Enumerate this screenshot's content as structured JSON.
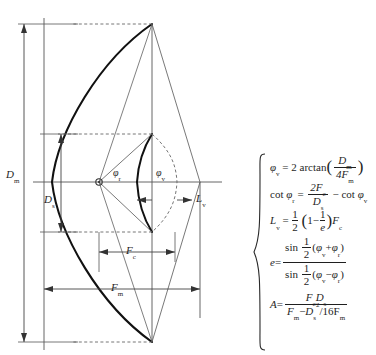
{
  "figure": {
    "colors": {
      "reflector_curve": "#111111",
      "construction_line": "#555555",
      "dimension_line": "#444444",
      "dashed_line": "#666666",
      "background": "#ffffff"
    },
    "labels": {
      "d_m": "D",
      "d_m_sub": "m",
      "d_s": "D",
      "d_s_sub": "s",
      "f_c": "F",
      "f_c_sub": "c",
      "f_m": "F",
      "f_m_sub": "m",
      "l_v": "L",
      "l_v_sub": "v",
      "phi_r": "φ",
      "phi_r_sub": "r",
      "phi_v": "φ",
      "phi_v_sub": "v"
    },
    "geometry": {
      "axis_y": 182,
      "vertex_x": 44,
      "focus_x": 99,
      "focus_y": 182,
      "rim_upper": [
        152,
        134
      ],
      "rim_lower": [
        152,
        232
      ],
      "aperture_top": [
        152,
        24
      ],
      "aperture_bottom": [
        152,
        342
      ],
      "right_edge_x": 200,
      "fm_right_x": 200,
      "fc_right_x": 175
    }
  },
  "equations": {
    "brace_label": "equation-group-brace",
    "items": [
      {
        "name": "phi-v-equation",
        "plain": "φ_v = 2 arctan( D_m / 4F_m )",
        "lhs": "φ",
        "lhs_sub": "v",
        "rhs_lead": "2 arctan",
        "num": "D",
        "num_sub": "m",
        "den": "4F",
        "den_sub": "m"
      },
      {
        "name": "cot-phi-r-equation",
        "plain": "cot φ_r = 2F_c / D_s − cot φ_v",
        "op": "cot",
        "lhs": "φ",
        "lhs_sub": "r",
        "num": "2F",
        "num_sub": "c",
        "den": "D",
        "den_sub": "s",
        "tail_op": "cot",
        "tail": "φ",
        "tail_sub": "v"
      },
      {
        "name": "l-v-equation",
        "plain": "L_v = 1/2 ( 1 − 1/e ) F_c",
        "lhs": "L",
        "lhs_sub": "v",
        "half_num": "1",
        "half_den": "2",
        "inner_one": "1",
        "inner_num": "1",
        "inner_den": "e",
        "tail": "F",
        "tail_sub": "c"
      },
      {
        "name": "e-equation",
        "plain": "e = sin 1/2 (φ_v + φ_r) / sin 1/2 (φ_v − φ_r)",
        "lhs": "e",
        "num_op": "sin",
        "num_half_num": "1",
        "num_half_den": "2",
        "num_a": "φ",
        "num_a_sub": "v",
        "num_sign": "+",
        "num_b": "φ",
        "num_b_sub": "r",
        "den_op": "sin",
        "den_half_num": "1",
        "den_half_den": "2",
        "den_a": "φ",
        "den_a_sub": "v",
        "den_sign": "−",
        "den_b": "φ",
        "den_b_sub": "r"
      },
      {
        "name": "a-equation",
        "plain": "A = F_c D_s / ( F_m − D_s^2 / 16F_m )",
        "lhs": "A",
        "num_a": "F",
        "num_a_sub": "c",
        "num_b": "D",
        "num_b_sub": "s",
        "den_a": "F",
        "den_a_sub": "m",
        "den_sign": "−",
        "den_b": "D",
        "den_b_sub": "s",
        "den_b_sup": "2",
        "den_c": "/16F",
        "den_c_sub": "m"
      }
    ]
  }
}
